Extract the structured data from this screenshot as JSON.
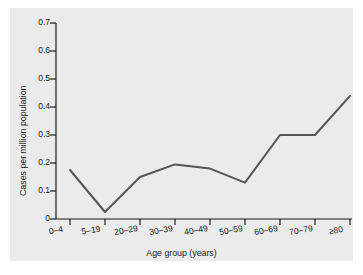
{
  "chart_data": {
    "type": "line",
    "title": "",
    "xlabel": "Age group (years)",
    "ylabel": "Cases per million population",
    "categories": [
      "0–4",
      "5–19",
      "20–29",
      "30–39",
      "40–49",
      "50–59",
      "60–69",
      "70–79",
      "≥80"
    ],
    "values": [
      0.175,
      0.025,
      0.15,
      0.195,
      0.18,
      0.13,
      0.3,
      0.3,
      0.44
    ],
    "series": [
      {
        "name": "Cases per million population",
        "values": [
          0.175,
          0.025,
          0.15,
          0.195,
          0.18,
          0.13,
          0.3,
          0.3,
          0.44
        ]
      }
    ],
    "ylim": [
      0,
      0.7
    ],
    "yticks": [
      0,
      0.1,
      0.2,
      0.3,
      0.4,
      0.5,
      0.6,
      0.7
    ],
    "ytick_labels": [
      "0",
      "0.1",
      "0.2",
      "0.3",
      "0.4",
      "0.5",
      "0.6",
      "0.7"
    ],
    "grid": false,
    "legend": "none",
    "line_color": "#555555",
    "axis_color": "#1b1b1b",
    "panel_color": "#ebebeb"
  }
}
